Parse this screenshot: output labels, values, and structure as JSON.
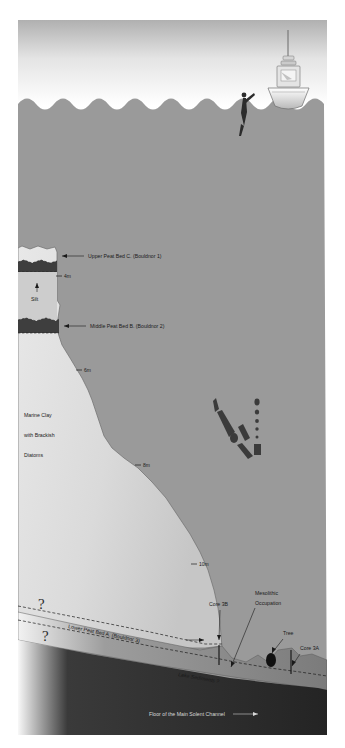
{
  "colors": {
    "sky_top": "#b4b4b4",
    "sky_bottom": "#ffffff",
    "water": "#9a9a9a",
    "marine_clay_light": "#e2e2e2",
    "marine_clay_mid": "#d0d0d0",
    "silt": "#cfcfcf",
    "peat_dark": "#3c3c3c",
    "peat_band": "#8d8d8d",
    "lake_sediment": "#6f6f6f",
    "channel_floor": "#2a2a2a",
    "outline": "#555555",
    "label_text": "#1a1a1a",
    "label_text_light": "#d8d8d8"
  },
  "labels": {
    "upper_peat": "Upper Peat Bed C. (Bouldnor 1)",
    "middle_peat": "Middle Peat Bed B. (Bouldnor 2)",
    "lower_peat": "Lower Peat Bed A. (Bouldnor 3)",
    "silt": "Silt",
    "marine_clay_line1": "Marine Clay",
    "marine_clay_line2": "with Brackish",
    "marine_clay_line3": "Diatoms",
    "core_3b": "Core 3B",
    "core_3a": "Core 3A",
    "mesolithic_line1": "Mesolithic",
    "mesolithic_line2": "Occupation",
    "tree": "Tree",
    "lake_sediments": "Lake Sediments ?",
    "channel_floor": "Floor of the Main Solent Channel",
    "query_upper": "?",
    "query_lower": "?"
  },
  "depth_markers": [
    {
      "label": "4m",
      "x": 64,
      "y": 278
    },
    {
      "label": "6m",
      "x": 84,
      "y": 372
    },
    {
      "label": "8m",
      "x": 143,
      "y": 467
    },
    {
      "label": "10m",
      "x": 199,
      "y": 566
    }
  ],
  "scene": {
    "vessel": "survey-boat",
    "diver": "diver-figure",
    "water_column_objects": "suspended-sediment-plume",
    "tree_stump": "tree-stump-marker"
  }
}
